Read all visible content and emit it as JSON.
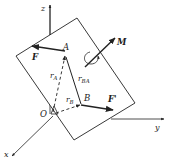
{
  "diagram": {
    "type": "force-couple translation diagram",
    "axes": {
      "x": {
        "label": "x"
      },
      "y": {
        "label": "y"
      },
      "z": {
        "label": "z"
      }
    },
    "origin": {
      "label": "O"
    },
    "points": {
      "A": {
        "label": "A"
      },
      "B": {
        "label": "B"
      }
    },
    "vectors": {
      "F": {
        "label": "F",
        "at": "A"
      },
      "F_prime": {
        "label": "F'",
        "at": "B"
      },
      "M": {
        "label": "M"
      },
      "r_A": {
        "label": "r",
        "sub": "A",
        "style": "dashed"
      },
      "r_B": {
        "label": "r",
        "sub": "B",
        "style": "dashed"
      },
      "r_BA": {
        "label": "r",
        "sub": "BA",
        "style": "solid"
      }
    },
    "colors": {
      "line": "#222222",
      "background": "#ffffff"
    }
  }
}
